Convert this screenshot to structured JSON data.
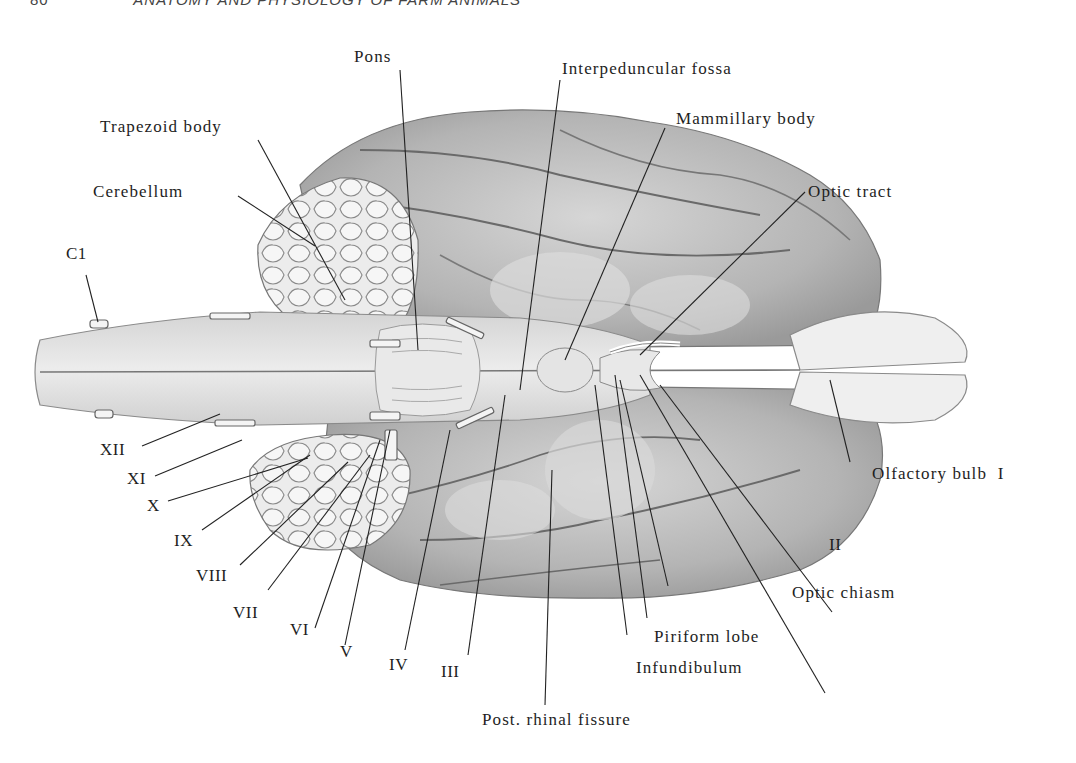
{
  "page": {
    "number": "80",
    "running_head": "ANATOMY AND PHYSIOLOGY OF FARM ANIMALS"
  },
  "figure": {
    "labels": {
      "pons": "Pons",
      "interpeduncular_fossa": "Interpeduncular fossa",
      "mammillary_body": "Mammillary body",
      "trapezoid_body": "Trapezoid body",
      "cerebellum": "Cerebellum",
      "optic_tract": "Optic tract",
      "c1": "C1",
      "olfactory_bulb": "Olfactory bulb  I",
      "xii": "XII",
      "xi": "XI",
      "x": "X",
      "ix": "IX",
      "viii": "VIII",
      "vii": "VII",
      "vi": "VI",
      "v": "V",
      "iv": "IV",
      "iii": "III",
      "ii": "II",
      "optic_chiasm": "Optic chiasm",
      "piriform_lobe": "Piriform lobe",
      "infundibulum": "Infundibulum",
      "post_rhinal_fissure": "Post. rhinal fissure"
    },
    "colors": {
      "ink": "#1e1e1e",
      "tissue_light": "#e6e6e6",
      "tissue_mid": "#c9c9c9",
      "tissue_dark": "#8e8e8e",
      "background": "#ffffff"
    }
  }
}
